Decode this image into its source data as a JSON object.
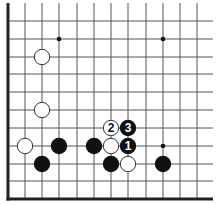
{
  "diagram": {
    "type": "go-board-corner",
    "colors": {
      "background": "#ffffff",
      "grid": "#555555",
      "edge": "#222222",
      "black_stone": "#111111",
      "white_stone": "#ffffff",
      "white_stroke": "#333333",
      "star": "#111111"
    },
    "grid": {
      "xs": [
        8,
        25,
        42,
        59,
        77,
        94,
        111,
        128,
        146,
        163,
        180,
        197
      ],
      "ys": [
        21,
        39,
        57,
        74,
        92,
        110,
        128,
        146,
        164,
        181,
        199
      ],
      "line_top": 3,
      "line_right": 213,
      "left_edge": 8,
      "bottom_edge": 199
    },
    "star_points": [
      {
        "x": 59,
        "y": 39
      },
      {
        "x": 163,
        "y": 39
      },
      {
        "x": 163,
        "y": 146
      }
    ],
    "stones": [
      {
        "color": "white",
        "x": 42,
        "y": 57,
        "label": ""
      },
      {
        "color": "white",
        "x": 42,
        "y": 110,
        "label": ""
      },
      {
        "color": "white",
        "x": 111,
        "y": 128,
        "label": "2"
      },
      {
        "color": "black",
        "x": 128,
        "y": 128,
        "label": "3"
      },
      {
        "color": "white",
        "x": 25,
        "y": 146,
        "label": ""
      },
      {
        "color": "black",
        "x": 59,
        "y": 146,
        "label": ""
      },
      {
        "color": "black",
        "x": 94,
        "y": 146,
        "label": ""
      },
      {
        "color": "white",
        "x": 111,
        "y": 146,
        "label": ""
      },
      {
        "color": "black",
        "x": 128,
        "y": 146,
        "label": "1"
      },
      {
        "color": "black",
        "x": 42,
        "y": 164,
        "label": ""
      },
      {
        "color": "black",
        "x": 111,
        "y": 164,
        "label": ""
      },
      {
        "color": "white",
        "x": 128,
        "y": 164,
        "label": ""
      },
      {
        "color": "black",
        "x": 163,
        "y": 164,
        "label": ""
      }
    ],
    "stone_radius": 8.2
  }
}
